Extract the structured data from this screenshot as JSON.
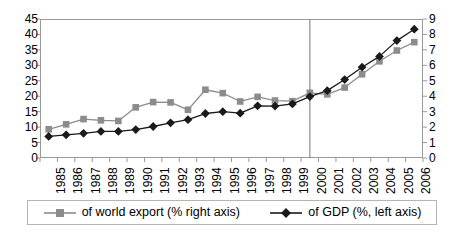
{
  "chart_data": {
    "type": "line",
    "title": "",
    "subtitle": "",
    "xlabel": "",
    "ylabel": "",
    "grid": false,
    "legend_position": "bottom",
    "categories": [
      "1985",
      "1986",
      "1987",
      "1988",
      "1989",
      "1990",
      "1991",
      "1992",
      "1993",
      "1994",
      "1995",
      "1996",
      "1997",
      "1998",
      "1999",
      "2000",
      "2001",
      "2002",
      "2003",
      "2004",
      "2005",
      "2006"
    ],
    "x": [
      1985,
      1986,
      1987,
      1988,
      1989,
      1990,
      1991,
      1992,
      1993,
      1994,
      1995,
      1996,
      1997,
      1998,
      1999,
      2000,
      2001,
      2002,
      2003,
      2004,
      2005,
      2006
    ],
    "left_axis": {
      "label": "",
      "ylim": [
        0,
        45
      ],
      "ticks": [
        0,
        5,
        10,
        15,
        20,
        25,
        30,
        35,
        40,
        45
      ],
      "tick_labels": [
        "0",
        "5",
        "10",
        "15",
        "20",
        "25",
        "30",
        "35",
        "40",
        "45"
      ]
    },
    "right_axis": {
      "label": "",
      "ylim": [
        0,
        9
      ],
      "ticks": [
        0,
        1,
        2,
        3,
        4,
        5,
        6,
        7,
        8,
        9
      ],
      "tick_labels": [
        "0",
        "1",
        "2",
        "3",
        "4",
        "5",
        "6",
        "7",
        "8",
        "9"
      ]
    },
    "series": [
      {
        "name": "of world export (% right axis)",
        "axis": "right",
        "color": "#8c8c8c",
        "marker": "square",
        "values_left_scale": [
          9.3,
          10.9,
          12.6,
          12.2,
          12.0,
          16.4,
          18.1,
          18.0,
          15.6,
          22.1,
          21.0,
          18.3,
          19.8,
          18.6,
          18.4,
          21.1,
          20.6,
          22.8,
          27.1,
          31.3,
          34.8,
          37.5
        ],
        "values": [
          1.86,
          2.18,
          2.52,
          2.44,
          2.4,
          3.28,
          3.62,
          3.6,
          3.12,
          4.42,
          4.2,
          3.66,
          3.96,
          3.72,
          3.68,
          4.22,
          4.12,
          4.56,
          5.42,
          6.26,
          6.96,
          7.5
        ]
      },
      {
        "name": "of GDP (%, left axis)",
        "axis": "left",
        "color": "#1a1a1a",
        "marker": "diamond",
        "values": [
          7.0,
          7.5,
          8.0,
          8.6,
          8.6,
          9.2,
          10.2,
          11.4,
          12.4,
          14.4,
          15.0,
          14.5,
          16.9,
          16.8,
          17.5,
          19.9,
          21.8,
          25.4,
          29.4,
          32.9,
          38.0,
          41.7
        ]
      }
    ],
    "annotations": [
      {
        "type": "vertical-line",
        "at_category": "2000",
        "color": "#8c8c8c"
      }
    ]
  },
  "legend": {
    "entries": [
      {
        "label": "of world export (% right axis)",
        "marker": "square",
        "color": "#8c8c8c"
      },
      {
        "label": "of GDP (%, left axis)",
        "marker": "diamond",
        "color": "#1a1a1a"
      }
    ]
  }
}
